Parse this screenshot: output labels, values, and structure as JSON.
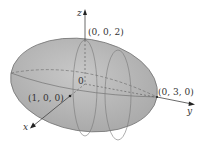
{
  "diagram": {
    "colors": {
      "fill": "#b4b4b4",
      "stroke": "#6a6a6a",
      "axis": "#444444"
    },
    "axes": {
      "x_label": "x",
      "y_label": "y",
      "z_label": "z"
    },
    "points": {
      "origin": "0",
      "x_intercept": "(1, 0, 0)",
      "y_intercept": "(0, 3, 0)",
      "z_intercept": "(0, 0, 2)"
    }
  }
}
